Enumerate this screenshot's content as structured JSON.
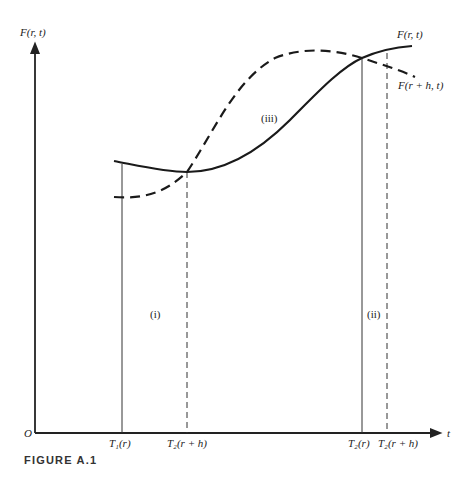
{
  "figure": {
    "caption": "FIGURE A.1",
    "origin_label": "O",
    "y_axis_label": "F(r, t)",
    "x_axis_label": "t"
  },
  "curves": {
    "solid": {
      "label": "F(r, t)",
      "style": "solid"
    },
    "dashed": {
      "label": "F(r + h, t)",
      "style": "dashed"
    }
  },
  "ticks": [
    {
      "label": "T₁(r)",
      "style": "solid"
    },
    {
      "label": "T₂(r + h)",
      "style": "dashed"
    },
    {
      "label": "T₂(r)",
      "style": "solid"
    },
    {
      "label": "T₂(r + h)",
      "style": "dashed"
    }
  ],
  "regions": {
    "i": "(i)",
    "ii": "(ii)",
    "iii": "(iii)"
  },
  "colors": {
    "ink": "#1a1a1a",
    "background": "#ffffff"
  }
}
